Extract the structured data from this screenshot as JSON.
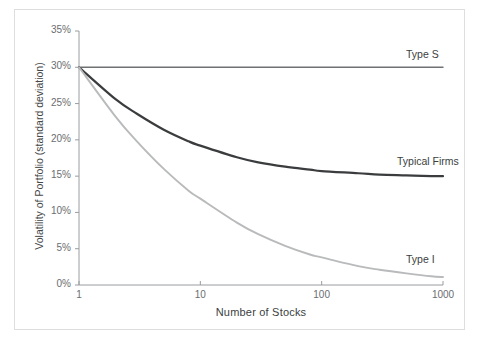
{
  "chart_data": {
    "type": "line",
    "title": "",
    "xlabel": "Number of Stocks",
    "ylabel": "Volatility of Portfolio (standard deviation)",
    "xscale": "log",
    "xlim": [
      1,
      1000
    ],
    "ylim": [
      0,
      35
    ],
    "xticks": [
      "1",
      "10",
      "100",
      "1000"
    ],
    "xtick_values": [
      1,
      10,
      100,
      1000
    ],
    "yticks": [
      "0%",
      "5%",
      "10%",
      "15%",
      "20%",
      "25%",
      "30%",
      "35%"
    ],
    "ytick_values": [
      0,
      5,
      10,
      15,
      20,
      25,
      30,
      35
    ],
    "grid": false,
    "legend": "inline-right-labels",
    "series": [
      {
        "name": "Type S",
        "color": "#6f7173",
        "width": 1.4,
        "x": [
          1,
          10,
          100,
          1000
        ],
        "values": [
          30,
          30,
          30,
          30
        ]
      },
      {
        "name": "Typical Firms",
        "color": "#3a3c3e",
        "width": 2.2,
        "x": [
          1,
          2,
          3,
          5,
          8,
          10,
          20,
          30,
          50,
          80,
          100,
          200,
          300,
          500,
          800,
          1000
        ],
        "values": [
          30.0,
          25.6,
          23.6,
          21.4,
          19.8,
          19.2,
          17.6,
          16.9,
          16.3,
          15.9,
          15.7,
          15.4,
          15.2,
          15.1,
          15.0,
          15.0
        ]
      },
      {
        "name": "Type I",
        "color": "#b9babb",
        "width": 1.9,
        "x": [
          1,
          2,
          3,
          5,
          8,
          10,
          20,
          30,
          50,
          80,
          100,
          200,
          300,
          500,
          800,
          1000
        ],
        "values": [
          30.0,
          23.2,
          19.8,
          16.0,
          13.0,
          11.9,
          8.6,
          7.0,
          5.4,
          4.2,
          3.8,
          2.6,
          2.1,
          1.6,
          1.2,
          1.1
        ]
      }
    ],
    "annotations": [
      {
        "text": "Type S",
        "x_px": 406,
        "y_px": 48
      },
      {
        "text": "Typical Firms",
        "x_px": 397,
        "y_px": 155
      },
      {
        "text": "Type I",
        "x_px": 406,
        "y_px": 253
      }
    ],
    "axis_color": "#9a9c9e",
    "frame_color": "#dedede",
    "background": "#ffffff"
  }
}
